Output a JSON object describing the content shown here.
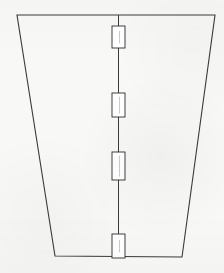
{
  "drawing": {
    "title": "Trapezoidal panel outline with centerline dimension callouts",
    "description": "Scanned monochrome technical line drawing",
    "background_color": "#f8f8f6",
    "line_color": "#3a3a3a",
    "label_fill_color": "#ffffff",
    "label_border_color": "#2e2e2e",
    "outline": {
      "name": "trapezoid-outline",
      "shape": "trapezoid",
      "points": "17,15 215,15 182,257 55,256",
      "vertices": [
        {
          "name": "top-left",
          "x": 17,
          "y": 15
        },
        {
          "name": "top-right",
          "x": 215,
          "y": 15
        },
        {
          "name": "bottom-right",
          "x": 182,
          "y": 257
        },
        {
          "name": "bottom-left",
          "x": 55,
          "y": 256
        }
      ],
      "stroke_width": 1.1
    },
    "centerline": {
      "name": "vertical-centerline",
      "x": 118.5,
      "y_start": 15,
      "y_end": 257,
      "stroke_width": 1.0
    },
    "callouts": [
      {
        "id": "callout-1",
        "name": "dimension-callout-1",
        "x": 112,
        "y": 26,
        "width": 13,
        "height": 22,
        "text": "———",
        "orientation": "vertical",
        "legible": false
      },
      {
        "id": "callout-2",
        "name": "dimension-callout-2",
        "x": 112,
        "y": 93,
        "width": 13,
        "height": 24,
        "text": "————",
        "orientation": "vertical",
        "legible": false
      },
      {
        "id": "callout-3",
        "name": "dimension-callout-3",
        "x": 112,
        "y": 152,
        "width": 13,
        "height": 28,
        "text": "—————",
        "orientation": "vertical",
        "legible": false
      },
      {
        "id": "callout-4",
        "name": "dimension-callout-4",
        "x": 112,
        "y": 234,
        "width": 13,
        "height": 24,
        "text": "———",
        "orientation": "vertical",
        "legible": false
      }
    ]
  }
}
